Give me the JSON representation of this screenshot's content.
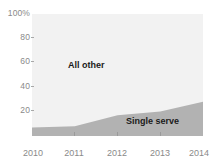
{
  "chart_data": {
    "type": "area",
    "stacked": true,
    "title": "",
    "subtitle": "",
    "xlabel": "",
    "ylabel": "",
    "x": [
      2010,
      2011,
      2012,
      2013,
      2014
    ],
    "xtick_labels": [
      "2010",
      "2011",
      "2012",
      "2013",
      "2014"
    ],
    "xlim": [
      2010,
      2014
    ],
    "ylim": [
      0,
      100
    ],
    "ytick_values": [
      100,
      80,
      60,
      40,
      20
    ],
    "ytick_labels": [
      "100%",
      "80",
      "60",
      "40",
      "20"
    ],
    "grid": false,
    "legend_position": "inline-annotations",
    "series": [
      {
        "name": "Single serve",
        "values": [
          7,
          8,
          17,
          20,
          28
        ],
        "color": "#b2b2b2",
        "annotation": "Single serve"
      },
      {
        "name": "All other",
        "values": [
          93,
          92,
          83,
          80,
          72
        ],
        "color": "#f2f2f2",
        "annotation": "All other"
      }
    ],
    "annotations": [
      {
        "text": "All other",
        "x": 2011.6,
        "y": 62
      },
      {
        "text": "Single serve",
        "x": 2013.3,
        "y": 17
      }
    ],
    "colors": {
      "plot_background": "#f2f2f2",
      "page_background": "#ffffff",
      "single_serve_fill": "#b2b2b2",
      "all_other_fill": "#f2f2f2",
      "axis_text": "#8a8a8a",
      "annotation_text": "#1a1a1a"
    }
  },
  "axes": {
    "y": {
      "ticks": [
        {
          "label": "100%",
          "value": 100
        },
        {
          "label": "80",
          "value": 80
        },
        {
          "label": "60",
          "value": 60
        },
        {
          "label": "40",
          "value": 40
        },
        {
          "label": "20",
          "value": 20
        }
      ]
    },
    "x": {
      "ticks": [
        {
          "label": "2010",
          "value": 2010
        },
        {
          "label": "2011",
          "value": 2011
        },
        {
          "label": "2012",
          "value": 2012
        },
        {
          "label": "2013",
          "value": 2013
        },
        {
          "label": "2014",
          "value": 2014
        }
      ]
    }
  },
  "annotations": {
    "all_other": "All other",
    "single_serve": "Single serve"
  }
}
